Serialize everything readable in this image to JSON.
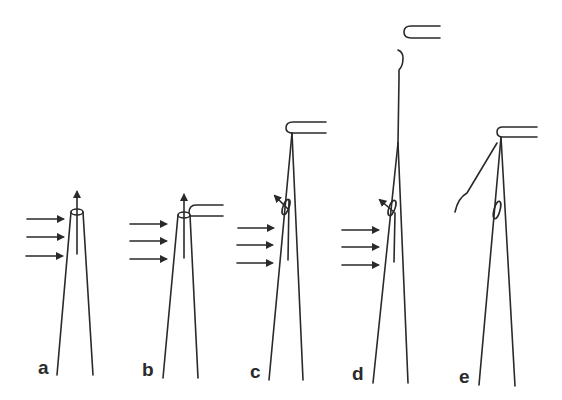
{
  "figure": {
    "panels": [
      {
        "id": "a",
        "label": "a",
        "stage": "flow applied, tip open, thread rising"
      },
      {
        "id": "b",
        "label": "b",
        "stage": "holding pipette approaches tip"
      },
      {
        "id": "c",
        "label": "c",
        "stage": "pipette holds thread, knot forming"
      },
      {
        "id": "d",
        "label": "d",
        "stage": "pipette pulled away, thread extended"
      },
      {
        "id": "e",
        "label": "e",
        "stage": "thread released, flow stopped"
      }
    ],
    "colors": {
      "line": "#2a2a2a",
      "background": "#ffffff"
    }
  }
}
